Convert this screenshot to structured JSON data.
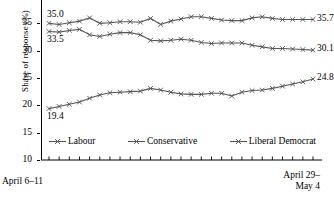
{
  "chart_data": {
    "type": "line",
    "title": "",
    "xlabel": "",
    "ylabel": "Share of response (%)",
    "ylim": [
      10,
      40
    ],
    "yticks": [
      10,
      15,
      20,
      25,
      30,
      35,
      40
    ],
    "ytick_labels": [
      "10",
      "15",
      "20",
      "25",
      "30",
      "35",
      "40"
    ],
    "grid": false,
    "legend_position": "inside-bottom",
    "x_axis_start_label": "April 6–11",
    "x_axis_end_label_line1": "April 29–",
    "x_axis_end_label_line2": "May 4",
    "n_points": 27,
    "marker": "x",
    "series": [
      {
        "name": "Labour",
        "color": "#555555",
        "start_value_label": "35.0",
        "end_value_label": "35.7",
        "values": [
          35.0,
          34.8,
          35.1,
          35.4,
          36.0,
          35.0,
          35.1,
          35.3,
          35.3,
          35.2,
          35.9,
          34.8,
          35.4,
          35.8,
          36.2,
          36.2,
          35.9,
          35.6,
          35.5,
          35.5,
          36.0,
          36.2,
          35.9,
          35.7,
          35.7,
          35.7,
          35.7
        ]
      },
      {
        "name": "Conservative",
        "color": "#555555",
        "start_value_label": "33.5",
        "end_value_label": "30.1",
        "values": [
          33.5,
          33.4,
          33.7,
          33.9,
          32.9,
          32.6,
          33.0,
          33.3,
          33.3,
          32.9,
          31.9,
          31.8,
          31.9,
          32.1,
          31.9,
          31.5,
          31.3,
          31.4,
          31.4,
          31.4,
          31.0,
          30.7,
          30.4,
          30.4,
          30.3,
          30.2,
          30.1
        ]
      },
      {
        "name": "Liberal Democrat",
        "color": "#555555",
        "start_value_label": "19.4",
        "end_value_label": "24.8",
        "values": [
          19.4,
          19.8,
          20.2,
          20.6,
          21.3,
          21.9,
          22.3,
          22.4,
          22.5,
          22.6,
          23.1,
          22.8,
          22.4,
          22.1,
          22.0,
          22.0,
          22.2,
          22.2,
          21.7,
          22.4,
          22.7,
          22.8,
          23.1,
          23.5,
          23.9,
          24.3,
          24.8
        ]
      }
    ]
  },
  "legend": {
    "items": [
      {
        "label": "Labour"
      },
      {
        "label": "Conservative"
      },
      {
        "label": "Liberal Democrat"
      }
    ]
  }
}
